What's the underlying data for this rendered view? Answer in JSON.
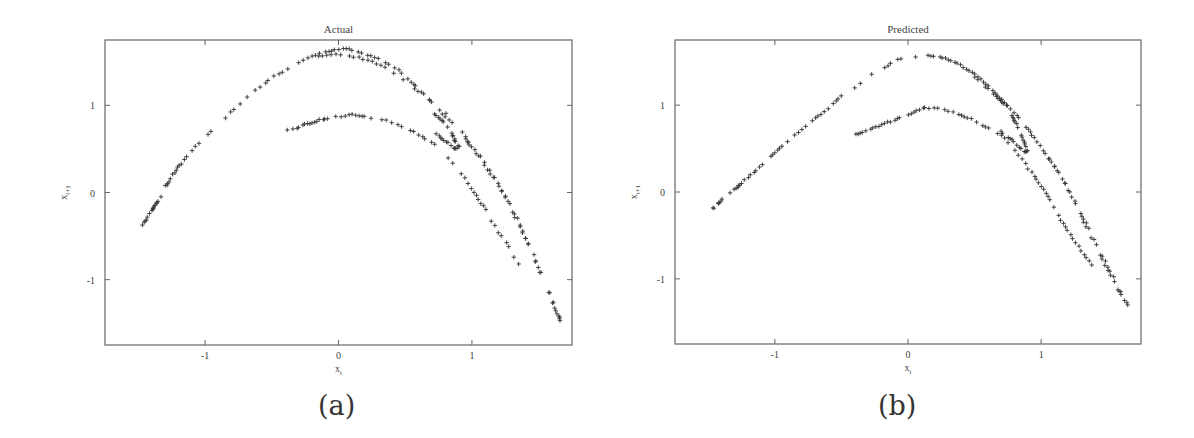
{
  "figure": {
    "panels": [
      {
        "id": "a",
        "title": "Actual",
        "caption": "(a)"
      },
      {
        "id": "b",
        "title": "Predicted",
        "caption": "(b)"
      }
    ]
  },
  "chart_data": [
    {
      "type": "scatter",
      "title": "Actual",
      "xlabel": "x_t",
      "ylabel": "x_{t+1}",
      "xlim": [
        -1.75,
        1.75
      ],
      "ylim": [
        -1.75,
        1.75
      ],
      "xticks": [
        -1,
        0,
        1
      ],
      "yticks": [
        -1,
        0,
        1
      ],
      "marker": "+",
      "grid": false,
      "legend": null,
      "branches": [
        {
          "name": "outer-arc",
          "points": [
            [
              -1.47,
              -0.38
            ],
            [
              -1.45,
              -0.33
            ],
            [
              -1.43,
              -0.28
            ],
            [
              -1.41,
              -0.23
            ],
            [
              -1.39,
              -0.18
            ],
            [
              -1.37,
              -0.14
            ],
            [
              -1.35,
              -0.1
            ],
            [
              -1.3,
              0.06
            ],
            [
              -1.28,
              0.1
            ],
            [
              -1.25,
              0.18
            ],
            [
              -1.22,
              0.26
            ],
            [
              -1.18,
              0.33
            ],
            [
              -1.12,
              0.45
            ],
            [
              -1.05,
              0.56
            ],
            [
              -0.98,
              0.67
            ],
            [
              -0.9,
              0.78
            ],
            [
              -0.85,
              0.86
            ],
            [
              -0.78,
              0.95
            ],
            [
              -0.72,
              1.04
            ],
            [
              -0.66,
              1.12
            ],
            [
              -0.55,
              1.26
            ],
            [
              -0.48,
              1.33
            ],
            [
              -0.42,
              1.38
            ],
            [
              -0.3,
              1.49
            ],
            [
              -0.2,
              1.57
            ],
            [
              -0.12,
              1.61
            ],
            [
              -0.05,
              1.63
            ],
            [
              0.02,
              1.65
            ],
            [
              0.08,
              1.64
            ],
            [
              0.15,
              1.62
            ],
            [
              0.22,
              1.58
            ],
            [
              0.3,
              1.53
            ],
            [
              0.38,
              1.47
            ],
            [
              0.45,
              1.4
            ],
            [
              0.52,
              1.3
            ],
            [
              0.58,
              1.22
            ],
            [
              0.64,
              1.13
            ],
            [
              0.7,
              1.04
            ],
            [
              0.78,
              0.9
            ],
            [
              0.85,
              0.8
            ],
            [
              0.95,
              0.62
            ],
            [
              1.0,
              0.52
            ],
            [
              1.05,
              0.42
            ],
            [
              1.12,
              0.26
            ],
            [
              1.18,
              0.12
            ],
            [
              1.25,
              -0.05
            ],
            [
              1.3,
              -0.22
            ],
            [
              1.36,
              -0.4
            ],
            [
              1.42,
              -0.6
            ],
            [
              1.48,
              -0.8
            ],
            [
              1.53,
              -0.98
            ],
            [
              1.58,
              -1.15
            ],
            [
              1.62,
              -1.32
            ],
            [
              1.65,
              -1.42
            ],
            [
              1.66,
              -1.47
            ]
          ]
        },
        {
          "name": "outer-arc-inner-band",
          "points": [
            [
              -0.15,
              1.56
            ],
            [
              -0.05,
              1.58
            ],
            [
              0.05,
              1.58
            ],
            [
              0.15,
              1.55
            ],
            [
              0.25,
              1.5
            ],
            [
              0.35,
              1.43
            ],
            [
              0.55,
              1.22
            ],
            [
              0.62,
              1.14
            ],
            [
              0.68,
              1.06
            ],
            [
              0.75,
              0.98
            ],
            [
              0.9,
              0.74
            ],
            [
              0.98,
              0.58
            ],
            [
              1.1,
              0.34
            ],
            [
              1.2,
              0.1
            ],
            [
              1.28,
              -0.12
            ],
            [
              1.34,
              -0.3
            ],
            [
              1.4,
              -0.52
            ],
            [
              1.46,
              -0.72
            ],
            [
              1.52,
              -0.92
            ],
            [
              1.57,
              -1.1
            ],
            [
              1.61,
              -1.26
            ]
          ]
        },
        {
          "name": "inner-arc",
          "points": [
            [
              -0.38,
              0.71
            ],
            [
              -0.34,
              0.73
            ],
            [
              -0.3,
              0.75
            ],
            [
              -0.25,
              0.78
            ],
            [
              -0.2,
              0.8
            ],
            [
              -0.15,
              0.83
            ],
            [
              -0.1,
              0.85
            ],
            [
              -0.05,
              0.86
            ],
            [
              0.05,
              0.88
            ],
            [
              0.1,
              0.89
            ],
            [
              0.15,
              0.88
            ],
            [
              0.22,
              0.86
            ],
            [
              0.3,
              0.84
            ],
            [
              0.38,
              0.82
            ],
            [
              0.45,
              0.78
            ],
            [
              0.52,
              0.73
            ],
            [
              0.58,
              0.69
            ],
            [
              0.65,
              0.62
            ],
            [
              0.72,
              0.55
            ],
            [
              0.82,
              0.4
            ],
            [
              0.92,
              0.22
            ],
            [
              1.0,
              0.05
            ],
            [
              1.05,
              -0.08
            ],
            [
              1.1,
              -0.2
            ],
            [
              1.15,
              -0.33
            ],
            [
              1.2,
              -0.46
            ],
            [
              1.26,
              -0.58
            ],
            [
              1.3,
              -0.7
            ],
            [
              1.35,
              -0.82
            ]
          ]
        },
        {
          "name": "kink",
          "points": [
            [
              0.7,
              0.7
            ],
            [
              0.74,
              0.66
            ],
            [
              0.78,
              0.62
            ],
            [
              0.82,
              0.57
            ],
            [
              0.86,
              0.52
            ],
            [
              0.88,
              0.5
            ],
            [
              0.9,
              0.52
            ],
            [
              0.88,
              0.58
            ],
            [
              0.86,
              0.64
            ],
            [
              0.84,
              0.7
            ],
            [
              0.8,
              0.78
            ],
            [
              0.76,
              0.85
            ],
            [
              0.72,
              0.9
            ]
          ]
        }
      ]
    },
    {
      "type": "scatter",
      "title": "Predicted",
      "xlabel": "x_t",
      "ylabel": "x_{t+1}",
      "xlim": [
        -1.75,
        1.75
      ],
      "ylim": [
        -1.75,
        1.75
      ],
      "xticks": [
        -1,
        0,
        1
      ],
      "yticks": [
        -1,
        0,
        1
      ],
      "marker": "+",
      "grid": false,
      "legend": null,
      "branches": [
        {
          "name": "outer-arc",
          "points": [
            [
              -1.47,
              -0.2
            ],
            [
              -1.45,
              -0.17
            ],
            [
              -1.43,
              -0.14
            ],
            [
              -1.41,
              -0.11
            ],
            [
              -1.39,
              -0.08
            ],
            [
              -1.37,
              -0.05
            ],
            [
              -1.32,
              0.02
            ],
            [
              -1.28,
              0.06
            ],
            [
              -1.25,
              0.1
            ],
            [
              -1.18,
              0.2
            ],
            [
              -1.12,
              0.28
            ],
            [
              -1.05,
              0.38
            ],
            [
              -1.0,
              0.46
            ],
            [
              -0.95,
              0.52
            ],
            [
              -0.88,
              0.62
            ],
            [
              -0.8,
              0.72
            ],
            [
              -0.72,
              0.82
            ],
            [
              -0.65,
              0.9
            ],
            [
              -0.58,
              1.0
            ],
            [
              -0.52,
              1.07
            ],
            [
              -0.45,
              1.16
            ],
            [
              -0.38,
              1.22
            ],
            [
              -0.3,
              1.32
            ],
            [
              -0.22,
              1.4
            ],
            [
              -0.15,
              1.46
            ],
            [
              -0.08,
              1.52
            ],
            [
              0.0,
              1.55
            ],
            [
              0.08,
              1.57
            ],
            [
              0.15,
              1.57
            ],
            [
              0.22,
              1.56
            ],
            [
              0.28,
              1.54
            ],
            [
              0.35,
              1.5
            ],
            [
              0.42,
              1.44
            ],
            [
              0.48,
              1.38
            ],
            [
              0.55,
              1.3
            ],
            [
              0.6,
              1.22
            ],
            [
              0.65,
              1.14
            ],
            [
              0.7,
              1.06
            ],
            [
              0.76,
              0.98
            ],
            [
              0.85,
              0.82
            ],
            [
              0.95,
              0.62
            ],
            [
              1.02,
              0.48
            ],
            [
              1.08,
              0.34
            ],
            [
              1.14,
              0.2
            ],
            [
              1.2,
              0.04
            ],
            [
              1.25,
              -0.1
            ],
            [
              1.3,
              -0.25
            ],
            [
              1.36,
              -0.42
            ],
            [
              1.42,
              -0.6
            ],
            [
              1.48,
              -0.8
            ],
            [
              1.54,
              -0.98
            ],
            [
              1.58,
              -1.12
            ],
            [
              1.62,
              -1.22
            ],
            [
              1.65,
              -1.3
            ]
          ]
        },
        {
          "name": "outer-arc-inner-band",
          "points": [
            [
              0.5,
              1.32
            ],
            [
              0.56,
              1.24
            ],
            [
              0.62,
              1.16
            ],
            [
              0.68,
              1.08
            ],
            [
              0.72,
              1.02
            ],
            [
              0.8,
              0.92
            ],
            [
              0.9,
              0.72
            ],
            [
              1.0,
              0.52
            ],
            [
              1.1,
              0.3
            ],
            [
              1.18,
              0.1
            ],
            [
              1.26,
              -0.14
            ],
            [
              1.32,
              -0.34
            ],
            [
              1.38,
              -0.52
            ],
            [
              1.44,
              -0.72
            ],
            [
              1.5,
              -0.9
            ],
            [
              1.55,
              -1.05
            ],
            [
              1.6,
              -1.18
            ]
          ]
        },
        {
          "name": "inner-arc",
          "points": [
            [
              -0.39,
              0.66
            ],
            [
              -0.34,
              0.69
            ],
            [
              -0.28,
              0.72
            ],
            [
              -0.22,
              0.76
            ],
            [
              -0.15,
              0.8
            ],
            [
              -0.08,
              0.84
            ],
            [
              -0.02,
              0.88
            ],
            [
              0.05,
              0.92
            ],
            [
              0.1,
              0.96
            ],
            [
              0.14,
              0.97
            ],
            [
              0.2,
              0.96
            ],
            [
              0.26,
              0.95
            ],
            [
              0.32,
              0.93
            ],
            [
              0.38,
              0.9
            ],
            [
              0.45,
              0.86
            ],
            [
              0.52,
              0.8
            ],
            [
              0.58,
              0.75
            ],
            [
              0.65,
              0.7
            ],
            [
              0.72,
              0.62
            ],
            [
              0.8,
              0.48
            ],
            [
              0.88,
              0.32
            ],
            [
              0.95,
              0.18
            ],
            [
              1.0,
              0.06
            ],
            [
              1.05,
              -0.05
            ],
            [
              1.1,
              -0.18
            ],
            [
              1.15,
              -0.32
            ],
            [
              1.2,
              -0.44
            ],
            [
              1.26,
              -0.58
            ],
            [
              1.32,
              -0.72
            ],
            [
              1.38,
              -0.84
            ]
          ]
        },
        {
          "name": "kink",
          "points": [
            [
              0.7,
              0.7
            ],
            [
              0.74,
              0.65
            ],
            [
              0.78,
              0.6
            ],
            [
              0.82,
              0.54
            ],
            [
              0.86,
              0.48
            ],
            [
              0.88,
              0.46
            ],
            [
              0.9,
              0.48
            ],
            [
              0.88,
              0.55
            ],
            [
              0.86,
              0.62
            ],
            [
              0.84,
              0.68
            ],
            [
              0.82,
              0.76
            ],
            [
              0.8,
              0.82
            ],
            [
              0.78,
              0.88
            ]
          ]
        }
      ]
    }
  ]
}
